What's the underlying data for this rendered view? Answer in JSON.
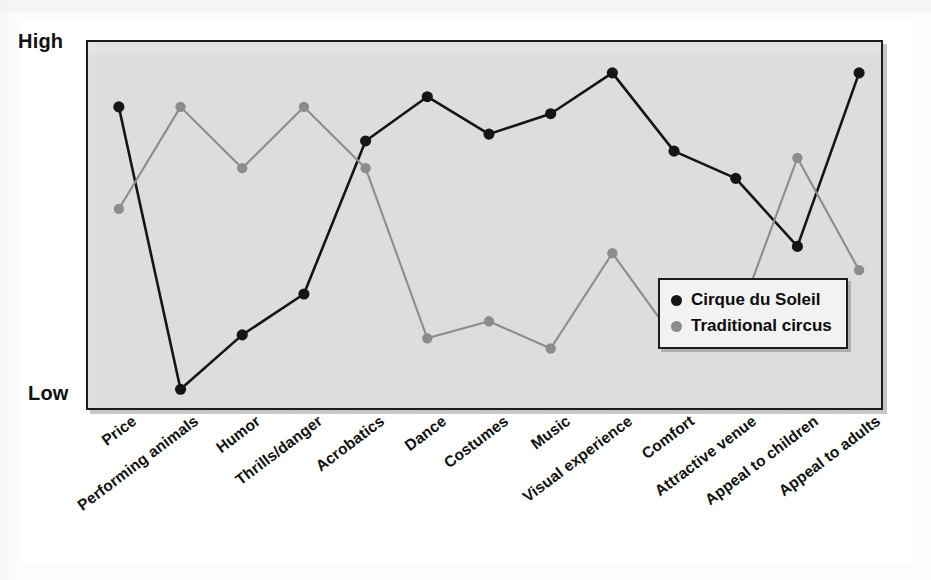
{
  "figure": {
    "axis": {
      "y_high_label": "High",
      "y_low_label": "Low"
    },
    "legend": {
      "items": [
        {
          "label": "Cirque du Soleil",
          "color": "#151515",
          "icon": "filled-circle-marker"
        },
        {
          "label": "Traditional circus",
          "color": "#8c8c8c",
          "icon": "filled-circle-marker"
        }
      ]
    },
    "colors": {
      "panel_background": "#dddddd",
      "frame": "#1c1c1c",
      "series_primary": "#151515",
      "series_secondary": "#8c8c8c",
      "page_background": "#ffffff"
    }
  },
  "chart_data": {
    "type": "line",
    "title": "",
    "subtitle": "",
    "xlabel": "",
    "ylabel": "",
    "ylim": [
      0,
      100
    ],
    "ytick_labels": [
      "Low",
      "High"
    ],
    "grid": false,
    "legend_position": "inside-bottom-right",
    "categories": [
      "Price",
      "Performing animals",
      "Humor",
      "Thrills/danger",
      "Acrobatics",
      "Dance",
      "Costumes",
      "Music",
      "Visual experience",
      "Comfort",
      "Attractive venue",
      "Appeal to children",
      "Appeal to adults"
    ],
    "series": [
      {
        "name": "Cirque du Soleil",
        "color": "#151515",
        "values": [
          85,
          2,
          18,
          30,
          75,
          88,
          77,
          83,
          95,
          72,
          64,
          44,
          95
        ]
      },
      {
        "name": "Traditional circus",
        "color": "#8c8c8c",
        "values": [
          55,
          85,
          67,
          85,
          67,
          17,
          22,
          14,
          42,
          17,
          21,
          70,
          37
        ]
      }
    ]
  }
}
